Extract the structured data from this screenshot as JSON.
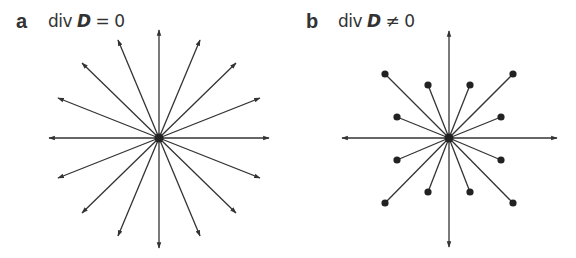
{
  "panels": [
    {
      "letter": "a",
      "eq_prefix": "div ",
      "eq_vector": "D",
      "eq_suffix": " = 0",
      "description": "Radial field lines with arrowheads extending outward from a central point charge; field lines continue indefinitely (source-free region)",
      "center": [
        159,
        138
      ],
      "line_count": 16,
      "line_end": "arrow"
    },
    {
      "letter": "b",
      "eq_prefix": "div ",
      "eq_vector": "D",
      "eq_suffix": " ≠ 0",
      "description": "Radial field lines: 4 axis lines end in arrows, 12 diagonal lines end in dots (field lines begin/end at charges)",
      "center": [
        449,
        138
      ],
      "line_count": 16,
      "line_end": "mixed: 4 arrows on axes, 12 dots"
    }
  ],
  "colors": {
    "stroke": "#333333",
    "background": "#ffffff"
  }
}
